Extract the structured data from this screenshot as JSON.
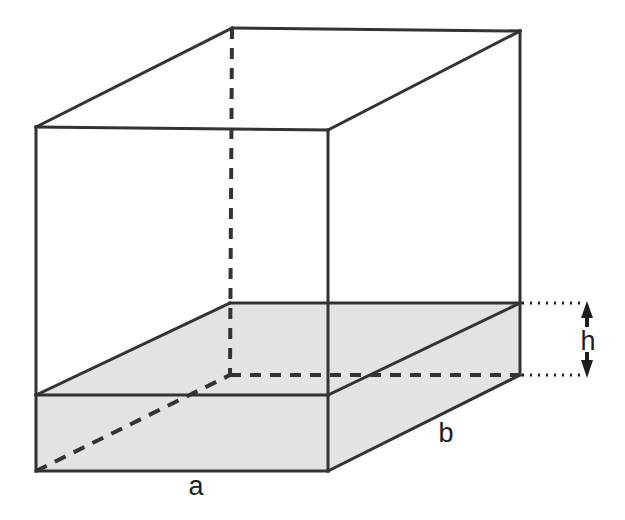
{
  "figure": {
    "kind": "geometry-diagram",
    "background_color": "#ffffff",
    "stroke_color": "#333333",
    "shade_color": "#e3e3e3",
    "labels": [
      {
        "id": "a",
        "text": "a",
        "x": 196,
        "y": 486,
        "meaning": "base-edge-length-a"
      },
      {
        "id": "b",
        "text": "b",
        "x": 446,
        "y": 433,
        "meaning": "base-edge-length-b"
      },
      {
        "id": "h",
        "text": "h",
        "x": 588,
        "y": 341,
        "meaning": "slab-height-h"
      }
    ],
    "solid": {
      "name": "outer-box",
      "vertices": {
        "front_top_left": [
          36,
          127
        ],
        "front_top_right": [
          328,
          130
        ],
        "back_top_left": [
          232,
          28
        ],
        "back_top_right": [
          520,
          31
        ],
        "front_bottom_left": [
          36,
          471
        ],
        "front_bottom_right": [
          328,
          471
        ],
        "back_bottom_left": [
          230,
          375
        ],
        "back_bottom_right": [
          520,
          375
        ]
      }
    },
    "slab": {
      "name": "shaded-slab",
      "fill": "#e3e3e3",
      "top_face": [
        [
          36,
          395
        ],
        [
          328,
          395
        ],
        [
          520,
          303
        ],
        [
          230,
          303
        ]
      ],
      "front_face": [
        [
          36,
          395
        ],
        [
          328,
          395
        ],
        [
          328,
          471
        ],
        [
          36,
          471
        ]
      ],
      "right_face": [
        [
          328,
          395
        ],
        [
          520,
          303
        ],
        [
          520,
          375
        ],
        [
          328,
          471
        ]
      ]
    },
    "hidden_edges": {
      "style": "dashed",
      "vertical": [
        [
          232,
          28
        ],
        [
          230,
          375
        ]
      ],
      "horizontal_to_right": [
        [
          230,
          375
        ],
        [
          520,
          375
        ]
      ],
      "diagonal_base": [
        [
          36,
          471
        ],
        [
          230,
          375
        ]
      ]
    },
    "dimension_indicator": {
      "name": "height-h",
      "style": "dotted-leaders-with-double-arrow",
      "leader_top": [
        [
          522,
          303
        ],
        [
          586,
          303
        ]
      ],
      "leader_bottom": [
        [
          522,
          375
        ],
        [
          586,
          375
        ]
      ],
      "arrow_x": 587,
      "arrow_top_y": 303,
      "arrow_bottom_y": 375
    }
  }
}
